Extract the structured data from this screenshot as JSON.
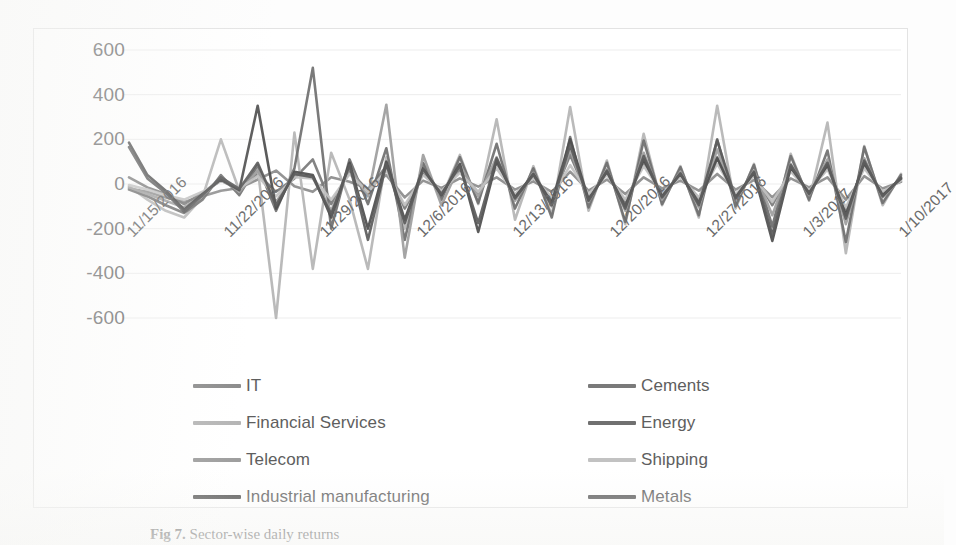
{
  "figure": {
    "caption_prefix": "Fig 7.",
    "caption_text": "Sector-wise daily returns"
  },
  "chart_data": {
    "type": "line",
    "title": "",
    "xlabel": "",
    "ylabel": "",
    "ylim": [
      -600,
      600
    ],
    "ytick_values": [
      600,
      400,
      200,
      0,
      -200,
      -400,
      -600
    ],
    "ytick_labels": [
      "600",
      "400",
      "200",
      "0",
      "-200",
      "-400",
      "-600"
    ],
    "grid": true,
    "legend_position": "bottom",
    "legend_columns": 2,
    "x_tick_labels": [
      "11/15/2016",
      "11/22/2016",
      "11/29/2016",
      "12/6/2016",
      "12/13/2016",
      "12/20/2016",
      "12/27/2016",
      "1/3/2017",
      "1/10/2017"
    ],
    "x_tick_rotation": -45,
    "n_points": 43,
    "x_indices": [
      0,
      1,
      2,
      3,
      4,
      5,
      6,
      7,
      8,
      9,
      10,
      11,
      12,
      13,
      14,
      15,
      16,
      17,
      18,
      19,
      20,
      21,
      22,
      23,
      24,
      25,
      26,
      27,
      28,
      29,
      30,
      31,
      32,
      33,
      34,
      35,
      36,
      37,
      38,
      39,
      40,
      41,
      42
    ],
    "series": [
      {
        "name": "IT",
        "color": "#8c8c8c",
        "values": [
          -20,
          -35,
          -60,
          -80,
          -55,
          -30,
          -18,
          20,
          60,
          -10,
          -35,
          30,
          10,
          -20,
          40,
          -60,
          15,
          -18,
          25,
          -12,
          30,
          -25,
          12,
          -35,
          55,
          -30,
          20,
          -45,
          30,
          -20,
          15,
          -30,
          45,
          -25,
          18,
          -60,
          25,
          -15,
          30,
          -70,
          35,
          -20,
          10
        ]
      },
      {
        "name": "Cements",
        "color": "#7a7a7a",
        "values": [
          30,
          -15,
          -45,
          -90,
          -40,
          15,
          -25,
          45,
          -35,
          25,
          110,
          -90,
          60,
          -30,
          80,
          -110,
          45,
          -30,
          60,
          -40,
          95,
          -55,
          35,
          -70,
          130,
          -60,
          50,
          -80,
          95,
          -45,
          40,
          -65,
          120,
          -55,
          45,
          -95,
          60,
          -35,
          75,
          -120,
          80,
          -40,
          20
        ]
      },
      {
        "name": "Financial Services",
        "color": "#b5b5b5",
        "values": [
          -10,
          -70,
          -120,
          -150,
          -60,
          200,
          -30,
          70,
          -600,
          230,
          -380,
          140,
          -70,
          -380,
          120,
          -200,
          90,
          -60,
          130,
          -90,
          290,
          -160,
          80,
          -140,
          345,
          -120,
          105,
          -180,
          225,
          -95,
          80,
          -150,
          350,
          -110,
          90,
          -210,
          135,
          -75,
          275,
          -310,
          170,
          -95,
          45
        ]
      },
      {
        "name": "Energy",
        "color": "#707070",
        "values": [
          -25,
          -55,
          -95,
          -130,
          -70,
          40,
          -50,
          85,
          -120,
          70,
          520,
          -200,
          110,
          -90,
          160,
          -250,
          95,
          -70,
          120,
          -85,
          180,
          -110,
          70,
          -150,
          210,
          -105,
          95,
          -170,
          195,
          -90,
          75,
          -140,
          200,
          -100,
          85,
          -190,
          125,
          -70,
          150,
          -260,
          165,
          -85,
          40
        ]
      },
      {
        "name": "Telecom",
        "color": "#9e9e9e",
        "values": [
          -15,
          -45,
          -75,
          -105,
          -50,
          25,
          -35,
          60,
          -80,
          40,
          35,
          -120,
          75,
          -55,
          355,
          -330,
          130,
          -95,
          85,
          -55,
          120,
          -75,
          50,
          -100,
          155,
          -80,
          65,
          -120,
          140,
          -70,
          55,
          -105,
          155,
          -75,
          60,
          -140,
          90,
          -50,
          110,
          -180,
          115,
          -60,
          25
        ]
      },
      {
        "name": "Shipping",
        "color": "#c2c2c2",
        "values": [
          -5,
          -25,
          -50,
          -70,
          -35,
          15,
          -20,
          35,
          -55,
          30,
          25,
          -70,
          45,
          -35,
          60,
          -95,
          40,
          -30,
          50,
          -35,
          70,
          -45,
          30,
          -60,
          85,
          -45,
          40,
          -70,
          80,
          -40,
          32,
          -60,
          90,
          -45,
          35,
          -80,
          55,
          -30,
          65,
          -105,
          70,
          -35,
          15
        ]
      },
      {
        "name": "Industrial manufacturing",
        "color": "#4f4f4f",
        "values": [
          185,
          40,
          -30,
          -115,
          -45,
          20,
          -28,
          350,
          -110,
          55,
          40,
          -150,
          95,
          -200,
          100,
          -160,
          70,
          -50,
          90,
          -215,
          105,
          -60,
          45,
          -85,
          200,
          -70,
          55,
          -100,
          110,
          -55,
          45,
          -85,
          115,
          -60,
          50,
          -255,
          75,
          -40,
          85,
          -140,
          95,
          -50,
          25
        ]
      },
      {
        "name": "Metals",
        "color": "#5c5c5c",
        "values": [
          165,
          25,
          -40,
          -125,
          -50,
          30,
          -22,
          95,
          -95,
          45,
          30,
          -135,
          85,
          -250,
          90,
          -175,
          65,
          -45,
          80,
          -175,
          115,
          -65,
          42,
          -95,
          175,
          -75,
          60,
          -110,
          125,
          -60,
          48,
          -95,
          195,
          -65,
          55,
          -230,
          85,
          -45,
          95,
          -155,
          105,
          -55,
          30
        ]
      }
    ]
  },
  "legend": {
    "items": [
      {
        "label": "IT",
        "color": "#8c8c8c",
        "col": 0,
        "row": 0
      },
      {
        "label": "Cements",
        "color": "#7a7a7a",
        "col": 1,
        "row": 0
      },
      {
        "label": "Financial Services",
        "color": "#b5b5b5",
        "col": 0,
        "row": 1
      },
      {
        "label": "Energy",
        "color": "#707070",
        "col": 1,
        "row": 1
      },
      {
        "label": "Telecom",
        "color": "#9e9e9e",
        "col": 0,
        "row": 2
      },
      {
        "label": "Shipping",
        "color": "#c2c2c2",
        "col": 1,
        "row": 2
      },
      {
        "label": "Industrial manufacturing",
        "color": "#4f4f4f",
        "col": 0,
        "row": 3
      },
      {
        "label": "Metals",
        "color": "#5c5c5c",
        "col": 1,
        "row": 3
      }
    ]
  },
  "style": {
    "plot_border_color": "#e3e3e3",
    "gridline_color": "#ededed",
    "axis_text_color": "#6e6e6e",
    "legend_text_color": "#5e5e5e",
    "background": "#ffffff"
  }
}
